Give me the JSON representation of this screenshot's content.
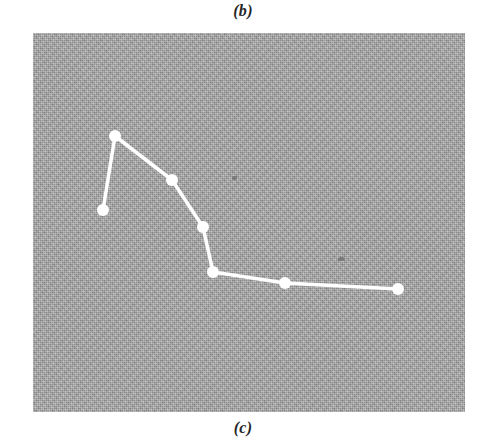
{
  "figure": {
    "caption_top": "(b)",
    "caption_bottom": "(c)",
    "panel": {
      "x": 33,
      "y": 33,
      "width": 432,
      "height": 379,
      "background_color": "#a9a9a9",
      "texture": "halftone-screen-gray"
    },
    "series_color": "#ffffff",
    "marker_color": "#ffffff",
    "marker_radius": 6,
    "line_width": 3.5,
    "specks": [
      {
        "name": "dust-speck-1",
        "x": 199,
        "y": 143,
        "w": 5,
        "h": 4
      },
      {
        "name": "dust-speck-2",
        "x": 305,
        "y": 224,
        "w": 7,
        "h": 4
      }
    ]
  },
  "chart_data": {
    "type": "line",
    "title": "",
    "subtitle": "",
    "xlabel": "",
    "ylabel": "",
    "grid": false,
    "legend": null,
    "axes_visible": false,
    "tick_labels_x": [],
    "tick_labels_y": [],
    "xlim": [
      0,
      432
    ],
    "ylim": [
      0,
      379
    ],
    "note": "Unlabeled decaying curve on a uniform gray halftone field; coordinates are panel-relative pixels with y measured downward from the panel top.",
    "series": [
      {
        "name": "curve",
        "points_px": [
          {
            "x": 70,
            "y": 177
          },
          {
            "x": 82,
            "y": 103
          },
          {
            "x": 139,
            "y": 147
          },
          {
            "x": 170,
            "y": 194
          },
          {
            "x": 180,
            "y": 239
          },
          {
            "x": 252,
            "y": 250
          },
          {
            "x": 365,
            "y": 256
          }
        ],
        "x": [
          70,
          82,
          139,
          170,
          180,
          252,
          365
        ],
        "values": [
          202,
          276,
          232,
          185,
          140,
          129,
          123
        ]
      }
    ]
  }
}
